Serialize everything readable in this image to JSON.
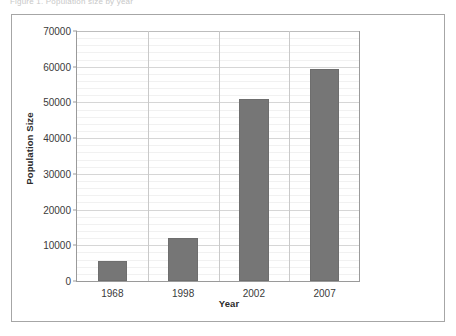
{
  "top_sliver": {
    "text": "Figure 1. Population size by year"
  },
  "chart_data": {
    "type": "bar",
    "title": "",
    "xlabel": "Year",
    "ylabel": "Population Size",
    "categories": [
      "1968",
      "1998",
      "2002",
      "2007"
    ],
    "values": [
      5600,
      12000,
      50900,
      59300
    ],
    "ylim": [
      0,
      70000
    ],
    "y_ticks": [
      0,
      10000,
      20000,
      30000,
      40000,
      50000,
      60000,
      70000
    ],
    "y_tick_labels": [
      "0",
      "10000",
      "20000",
      "30000",
      "40000",
      "50000",
      "60000",
      "70000"
    ],
    "y_minor_step": 2000,
    "grid": true,
    "legend": null,
    "bar_color": "#767676",
    "grid_major_color": "#d6d6d6",
    "grid_minor_color": "#f1f1f1",
    "axis_color": "#9a9a9a",
    "frame_color": "#a6a6a6"
  }
}
